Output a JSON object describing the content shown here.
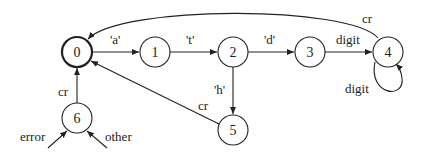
{
  "diagram": {
    "type": "state-machine",
    "states": [
      {
        "id": "0",
        "label": "0",
        "start": true
      },
      {
        "id": "1",
        "label": "1"
      },
      {
        "id": "2",
        "label": "2"
      },
      {
        "id": "3",
        "label": "3"
      },
      {
        "id": "4",
        "label": "4"
      },
      {
        "id": "5",
        "label": "5"
      },
      {
        "id": "6",
        "label": "6"
      }
    ],
    "transitions": [
      {
        "from": "0",
        "to": "1",
        "label": "'a'"
      },
      {
        "from": "1",
        "to": "2",
        "label": "'t'"
      },
      {
        "from": "2",
        "to": "3",
        "label": "'d'"
      },
      {
        "from": "3",
        "to": "4",
        "label": "digit"
      },
      {
        "from": "4",
        "to": "4",
        "label": "digit"
      },
      {
        "from": "4",
        "to": "0",
        "label": "cr"
      },
      {
        "from": "2",
        "to": "5",
        "label": "'h'"
      },
      {
        "from": "5",
        "to": "0",
        "label": "cr"
      },
      {
        "from": "6",
        "to": "0",
        "label": "cr"
      },
      {
        "from": "",
        "to": "6",
        "label": "error"
      },
      {
        "from": "",
        "to": "6",
        "label": "other"
      }
    ]
  }
}
